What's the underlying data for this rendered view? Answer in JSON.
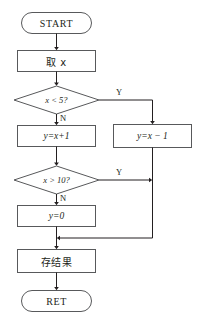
{
  "diagram": {
    "type": "flowchart",
    "title": "",
    "background_color": "#ffffff",
    "line_color": "#4d4d4f",
    "text_color": "#231f20",
    "nodes": [
      {
        "id": "start",
        "shape": "terminator",
        "label": "START"
      },
      {
        "id": "get_x",
        "shape": "process",
        "label": "取 x"
      },
      {
        "id": "dec1",
        "shape": "decision",
        "label": "x < 5?"
      },
      {
        "id": "assign_plus",
        "shape": "process",
        "label": "y=x+1"
      },
      {
        "id": "assign_minus",
        "shape": "process",
        "label": "y=x − 1"
      },
      {
        "id": "dec2",
        "shape": "decision",
        "label": "x > 10?"
      },
      {
        "id": "zero",
        "shape": "process",
        "label": "y=0"
      },
      {
        "id": "store",
        "shape": "process",
        "label": "存结果"
      },
      {
        "id": "ret",
        "shape": "terminator",
        "label": "RET"
      }
    ],
    "branch_labels": {
      "dec1_yes": "Y",
      "dec1_no": "N",
      "dec2_yes": "Y",
      "dec2_no": "N"
    }
  }
}
